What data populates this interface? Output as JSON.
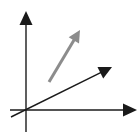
{
  "diagram": {
    "type": "vector-diagram",
    "background": "#ffffff",
    "axes": {
      "color": "#1a1a1a",
      "origin": [
        26,
        110
      ],
      "x_axis": {
        "start": [
          10,
          110
        ],
        "end": [
          137,
          110
        ]
      },
      "y_axis": {
        "start": [
          26,
          132
        ],
        "end": [
          26,
          11
        ]
      }
    },
    "vectors": [
      {
        "name": "dark-vector",
        "color": "#1a1a1a",
        "start": [
          11,
          117
        ],
        "end": [
          112,
          67
        ]
      },
      {
        "name": "gray-vector",
        "color": "#8c8c8c",
        "start": [
          49,
          82
        ],
        "end": [
          80,
          30
        ]
      }
    ]
  }
}
